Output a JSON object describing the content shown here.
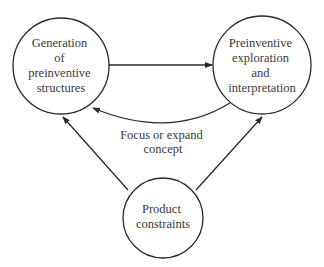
{
  "diagram": {
    "nodes": [
      {
        "id": "generation",
        "lines": [
          "Generation",
          "of",
          "preinventive",
          "structures"
        ]
      },
      {
        "id": "exploration",
        "lines": [
          "Preinventive",
          "exploration",
          "and",
          "interpretation"
        ]
      },
      {
        "id": "constraints",
        "lines": [
          "Product",
          "constraints"
        ]
      }
    ],
    "edges": [
      {
        "from": "generation",
        "to": "exploration",
        "label": ""
      },
      {
        "from": "exploration",
        "to": "generation",
        "label_lines": [
          "Focus or expand",
          "concept"
        ]
      },
      {
        "from": "constraints",
        "to": "generation",
        "label": ""
      },
      {
        "from": "constraints",
        "to": "exploration",
        "label": ""
      }
    ],
    "colors": {
      "stroke": "#2a2a2a",
      "text": "#3a3a3a",
      "background": "#ffffff"
    }
  }
}
